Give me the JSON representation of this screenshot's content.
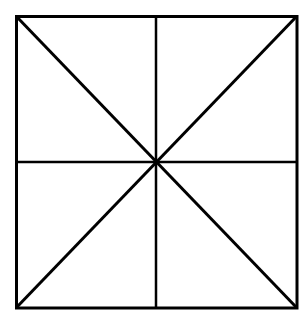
{
  "diagram": {
    "stroke_color": "#000000",
    "background": "#ffffff",
    "square": {
      "x1": 16,
      "y1": 16,
      "x2": 297,
      "y2": 308
    },
    "center": {
      "x": 156,
      "y": 162
    },
    "line_count": 4,
    "region_count": 8
  }
}
